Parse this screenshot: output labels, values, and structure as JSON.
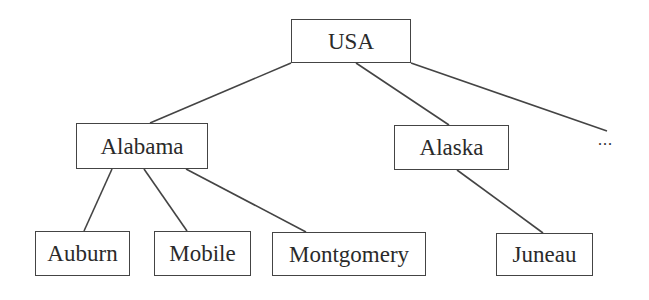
{
  "diagram": {
    "type": "tree",
    "root": "USA",
    "nodes": [
      {
        "id": "usa",
        "label": "USA"
      },
      {
        "id": "alabama",
        "label": "Alabama"
      },
      {
        "id": "alaska",
        "label": "Alaska"
      },
      {
        "id": "auburn",
        "label": "Auburn"
      },
      {
        "id": "mobile",
        "label": "Mobile"
      },
      {
        "id": "montgomery",
        "label": "Montgomery"
      },
      {
        "id": "juneau",
        "label": "Juneau"
      }
    ],
    "ellipsis": "...",
    "edges": [
      [
        "usa",
        "alabama"
      ],
      [
        "usa",
        "alaska"
      ],
      [
        "usa",
        "..."
      ],
      [
        "alabama",
        "auburn"
      ],
      [
        "alabama",
        "mobile"
      ],
      [
        "alabama",
        "montgomery"
      ],
      [
        "alaska",
        "juneau"
      ]
    ]
  }
}
